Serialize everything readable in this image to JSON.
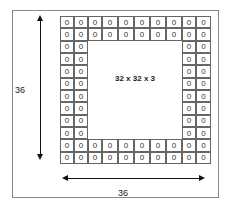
{
  "diagram": {
    "title": "",
    "center_label": "32 x 32 x 3",
    "height_label": "36",
    "width_label": "36",
    "pad_value": "0",
    "grid": {
      "rows": 12,
      "cols": 10,
      "border_rows": 2,
      "border_cols": 2,
      "col_edges": [
        0,
        14,
        28,
        42,
        58,
        74,
        90,
        106,
        122,
        136,
        151
      ],
      "height": 148
    },
    "colors": {
      "frame": "#8a8a8a",
      "grid_lines": "#555555",
      "arrows": "#111111",
      "background": "#ffffff"
    }
  }
}
